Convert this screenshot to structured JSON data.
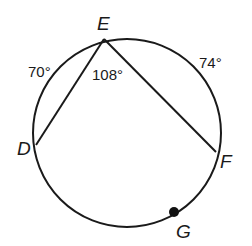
{
  "diagram": {
    "type": "circle-geometry",
    "circle": {
      "cx": 127,
      "cy": 133,
      "r": 94,
      "stroke": "#1a1a1a"
    },
    "points": {
      "E": {
        "label": "E",
        "x": 104,
        "y": 39
      },
      "D": {
        "label": "D",
        "x": 36,
        "y": 145
      },
      "F": {
        "label": "F",
        "x": 216,
        "y": 152
      },
      "G": {
        "label": "G",
        "x": 174,
        "y": 212
      }
    },
    "chords": [
      {
        "from": "E",
        "to": "D"
      },
      {
        "from": "E",
        "to": "F"
      }
    ],
    "measures": {
      "arc_DE": "70°",
      "arc_EF": "74°",
      "angle_DEF": "108°"
    }
  }
}
